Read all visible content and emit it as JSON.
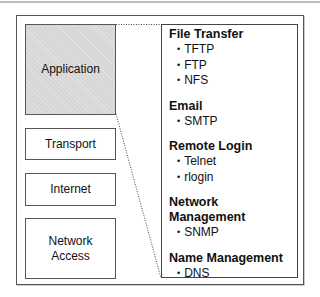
{
  "layers": [
    {
      "label": "Application",
      "highlighted": true
    },
    {
      "label": "Transport",
      "highlighted": false
    },
    {
      "label": "Internet",
      "highlighted": false
    },
    {
      "label": "Network Access",
      "highlighted": false
    }
  ],
  "detail": {
    "groups": [
      {
        "title": "File Transfer",
        "items": [
          "TFTP",
          "FTP",
          "NFS"
        ]
      },
      {
        "title": "Email",
        "items": [
          "SMTP"
        ]
      },
      {
        "title": "Remote Login",
        "items": [
          "Telnet",
          "rlogin"
        ]
      },
      {
        "title": "Network Management",
        "items": [
          "SNMP"
        ]
      },
      {
        "title": "Name Management",
        "items": [
          "DNS"
        ]
      }
    ]
  },
  "colors": {
    "highlight_fill": "#d6d6d6",
    "border": "#555555"
  }
}
